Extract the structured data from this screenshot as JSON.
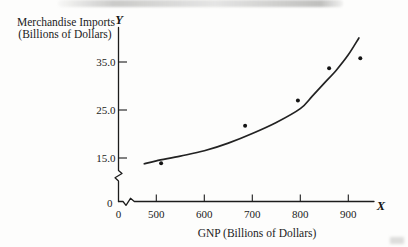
{
  "figure": {
    "y_axis_title_line1": "Merchandise Imports",
    "y_axis_title_line2": "(Billions of Dollars)",
    "x_axis_title": "GNP (Billions of Dollars)",
    "y_axis_letter": "Y",
    "x_axis_letter": "X",
    "y_origin_label": "0",
    "x_origin_label": "0"
  },
  "chart_data": {
    "type": "scatter",
    "title": "",
    "xlabel": "GNP (Billions of Dollars)",
    "ylabel": "Merchandise Imports (Billions of Dollars)",
    "x_tick_values": [
      500,
      600,
      700,
      800,
      900
    ],
    "x_tick_labels": [
      "500",
      "600",
      "700",
      "800",
      "900"
    ],
    "y_tick_values": [
      15,
      25,
      35
    ],
    "y_tick_labels": [
      "15.0",
      "25.0",
      "35.0"
    ],
    "xlim": [
      0,
      960
    ],
    "ylim": [
      0,
      42
    ],
    "axis_breaks": {
      "x_axis": true,
      "y_axis": true
    },
    "grid": false,
    "legend": false,
    "points": [
      {
        "x": 510,
        "y": 13.9
      },
      {
        "x": 685,
        "y": 21.7
      },
      {
        "x": 795,
        "y": 27.0
      },
      {
        "x": 860,
        "y": 33.7
      },
      {
        "x": 925,
        "y": 35.8
      }
    ],
    "curve_samples": [
      {
        "x": 475,
        "y": 13.8
      },
      {
        "x": 500,
        "y": 14.4
      },
      {
        "x": 550,
        "y": 15.4
      },
      {
        "x": 600,
        "y": 16.5
      },
      {
        "x": 650,
        "y": 18.1
      },
      {
        "x": 700,
        "y": 20.1
      },
      {
        "x": 750,
        "y": 22.4
      },
      {
        "x": 800,
        "y": 25.3
      },
      {
        "x": 825,
        "y": 27.9
      },
      {
        "x": 850,
        "y": 30.6
      },
      {
        "x": 875,
        "y": 33.3
      },
      {
        "x": 900,
        "y": 36.5
      },
      {
        "x": 922,
        "y": 40.0
      }
    ],
    "colors": {
      "ink": "#1c1c1c",
      "background": "#fdfdfc"
    }
  }
}
